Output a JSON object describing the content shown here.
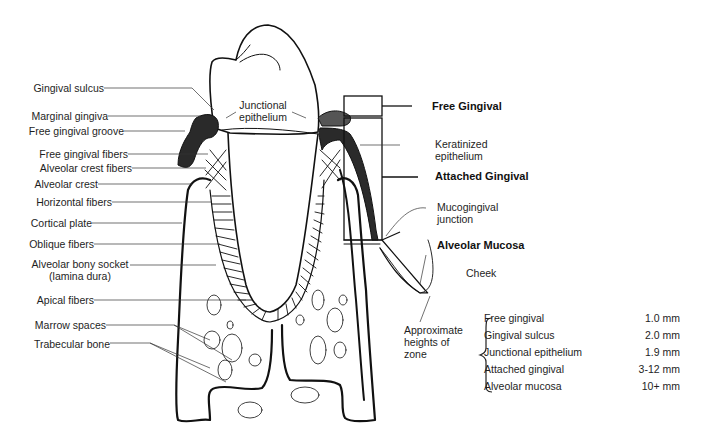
{
  "diagram": {
    "left_labels": [
      {
        "id": "gingival-sulcus",
        "text": "Gingival sulcus"
      },
      {
        "id": "marginal-gingiva",
        "text": "Marginal gingiva"
      },
      {
        "id": "free-gingival-groove",
        "text": "Free gingival groove"
      },
      {
        "id": "free-gingival-fibers",
        "text": "Free gingival fibers"
      },
      {
        "id": "alveolar-crest-fibers",
        "text": "Alveolar crest fibers"
      },
      {
        "id": "alveolar-crest",
        "text": "Alveolar crest"
      },
      {
        "id": "horizontal-fibers",
        "text": "Horizontal fibers"
      },
      {
        "id": "cortical-plate",
        "text": "Cortical plate"
      },
      {
        "id": "oblique-fibers",
        "text": "Oblique fibers"
      },
      {
        "id": "alveolar-bony-socket",
        "text": "Alveolar bony socket"
      },
      {
        "id": "lamina-dura",
        "text": "(lamina dura)"
      },
      {
        "id": "apical-fibers",
        "text": "Apical fibers"
      },
      {
        "id": "marrow-spaces",
        "text": "Marrow spaces"
      },
      {
        "id": "trabecular-bone",
        "text": "Trabecular bone"
      }
    ],
    "center_labels": {
      "junctional_line1": "Junctional",
      "junctional_line2": "epithelium"
    },
    "right_labels": {
      "free_gingival": "Free Gingival",
      "keratinized_line1": "Keratinized",
      "keratinized_line2": "epithelium",
      "attached_gingival": "Attached Gingival",
      "mucogingival_line1": "Mucogingival",
      "mucogingival_line2": "junction",
      "alveolar_mucosa": "Alveolar Mucosa",
      "cheek": "Cheek",
      "approx_line1": "Approximate",
      "approx_line2": "heights of",
      "approx_line3": "zone"
    },
    "zone_heights": [
      {
        "zone": "Free gingival",
        "height": "1.0 mm"
      },
      {
        "zone": "Gingival sulcus",
        "height": "2.0 mm"
      },
      {
        "zone": "Junctional epithelium",
        "height": "1.9 mm"
      },
      {
        "zone": "Attached gingival",
        "height": "3-12 mm"
      },
      {
        "zone": "Alveolar mucosa",
        "height": "10+ mm"
      }
    ]
  },
  "colors": {
    "ink": "#111111",
    "gingiva": "#2a2a2a",
    "paper": "#ffffff"
  }
}
